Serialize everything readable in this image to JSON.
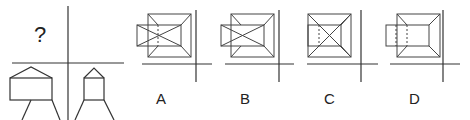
{
  "puzzle": {
    "question_mark": "?",
    "description": "Three-view drawing puzzle: front and side views given, top view missing"
  },
  "options": [
    {
      "label": "A"
    },
    {
      "label": "B"
    },
    {
      "label": "C"
    },
    {
      "label": "D"
    }
  ],
  "colors": {
    "line": "#333333",
    "background": "#ffffff"
  }
}
